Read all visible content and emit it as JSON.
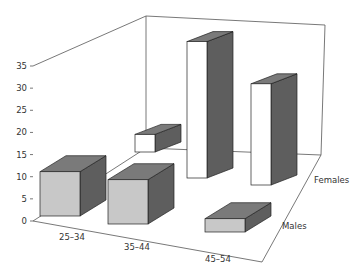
{
  "chart_data": {
    "type": "bar",
    "subtype": "3d-grouped",
    "title": "",
    "xlabel": "",
    "ylabel": "",
    "categories": [
      "25–34",
      "35–44",
      "45–54"
    ],
    "series": [
      {
        "name": "Males",
        "values": [
          10,
          10,
          3
        ],
        "color": "#c8c8c8"
      },
      {
        "name": "Females",
        "values": [
          4,
          31,
          23
        ],
        "color": "#ffffff"
      }
    ],
    "ylim": [
      0,
      35
    ],
    "yticks": [
      "0",
      "5",
      "10",
      "15",
      "20",
      "25",
      "30",
      "35"
    ],
    "depth_labels": [
      "Males",
      "Females"
    ],
    "grid": false,
    "legend": "none",
    "colors": {
      "top": "#7a7a7a",
      "side": "#5e5e5e",
      "axis": "#555555"
    }
  }
}
